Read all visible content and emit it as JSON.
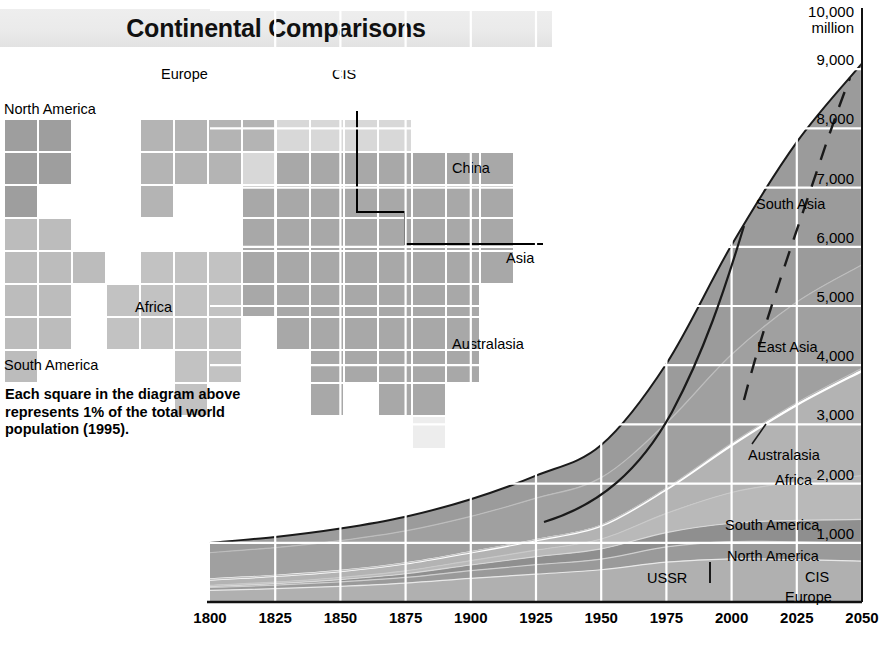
{
  "title": "Continental Comparisons",
  "waffle": {
    "caption": "Each square in the diagram above represents 1% of the total world population (1995).",
    "labels": {
      "north_america": "North America",
      "south_america": "South America",
      "europe": "Europe",
      "cis": "CIS",
      "africa": "Africa",
      "china": "China",
      "asia": "Asia",
      "australasia": "Australasia"
    },
    "cell_note": "1 square = 1% of world population (1995)",
    "colors": {
      "north_america": "#9e9e9e",
      "south_america": "#bcbcbc",
      "europe": "#b4b4b4",
      "cis": "#d8d8d8",
      "africa": "#c2c2c2",
      "asia": "#a8a8a8",
      "australasia": "#ededed"
    },
    "cells": [
      {
        "c": 0,
        "r": 0,
        "g": "north_america"
      },
      {
        "c": 1,
        "r": 0,
        "g": "north_america"
      },
      {
        "c": 0,
        "r": 1,
        "g": "north_america"
      },
      {
        "c": 1,
        "r": 1,
        "g": "north_america"
      },
      {
        "c": 0,
        "r": 2,
        "g": "north_america"
      },
      {
        "c": 0,
        "r": 3,
        "g": "south_america"
      },
      {
        "c": 1,
        "r": 3,
        "g": "south_america"
      },
      {
        "c": 0,
        "r": 4,
        "g": "south_america"
      },
      {
        "c": 1,
        "r": 4,
        "g": "south_america"
      },
      {
        "c": 2,
        "r": 4,
        "g": "south_america"
      },
      {
        "c": 0,
        "r": 5,
        "g": "south_america"
      },
      {
        "c": 1,
        "r": 5,
        "g": "south_america"
      },
      {
        "c": 0,
        "r": 6,
        "g": "south_america"
      },
      {
        "c": 1,
        "r": 6,
        "g": "south_america"
      },
      {
        "c": 0,
        "r": 7,
        "g": "south_america"
      },
      {
        "c": 4,
        "r": 0,
        "g": "europe"
      },
      {
        "c": 5,
        "r": 0,
        "g": "europe"
      },
      {
        "c": 6,
        "r": 0,
        "g": "europe"
      },
      {
        "c": 7,
        "r": 0,
        "g": "europe"
      },
      {
        "c": 8,
        "r": 0,
        "g": "cis"
      },
      {
        "c": 9,
        "r": 0,
        "g": "cis"
      },
      {
        "c": 10,
        "r": 0,
        "g": "cis"
      },
      {
        "c": 11,
        "r": 0,
        "g": "cis"
      },
      {
        "c": 4,
        "r": 1,
        "g": "europe"
      },
      {
        "c": 5,
        "r": 1,
        "g": "europe"
      },
      {
        "c": 6,
        "r": 1,
        "g": "europe"
      },
      {
        "c": 7,
        "r": 1,
        "g": "cis"
      },
      {
        "c": 4,
        "r": 2,
        "g": "europe"
      },
      {
        "c": 8,
        "r": 1,
        "g": "asia"
      },
      {
        "c": 9,
        "r": 1,
        "g": "asia"
      },
      {
        "c": 10,
        "r": 1,
        "g": "asia"
      },
      {
        "c": 11,
        "r": 1,
        "g": "asia"
      },
      {
        "c": 12,
        "r": 1,
        "g": "asia"
      },
      {
        "c": 13,
        "r": 1,
        "g": "asia"
      },
      {
        "c": 14,
        "r": 1,
        "g": "asia"
      },
      {
        "c": 7,
        "r": 2,
        "g": "asia"
      },
      {
        "c": 8,
        "r": 2,
        "g": "asia"
      },
      {
        "c": 9,
        "r": 2,
        "g": "asia"
      },
      {
        "c": 10,
        "r": 2,
        "g": "asia"
      },
      {
        "c": 11,
        "r": 2,
        "g": "asia"
      },
      {
        "c": 12,
        "r": 2,
        "g": "asia"
      },
      {
        "c": 13,
        "r": 2,
        "g": "asia"
      },
      {
        "c": 14,
        "r": 2,
        "g": "asia"
      },
      {
        "c": 7,
        "r": 3,
        "g": "asia"
      },
      {
        "c": 8,
        "r": 3,
        "g": "asia"
      },
      {
        "c": 9,
        "r": 3,
        "g": "asia"
      },
      {
        "c": 10,
        "r": 3,
        "g": "asia"
      },
      {
        "c": 11,
        "r": 3,
        "g": "asia"
      },
      {
        "c": 12,
        "r": 3,
        "g": "asia"
      },
      {
        "c": 13,
        "r": 3,
        "g": "asia"
      },
      {
        "c": 14,
        "r": 3,
        "g": "asia"
      },
      {
        "c": 4,
        "r": 4,
        "g": "africa"
      },
      {
        "c": 5,
        "r": 4,
        "g": "africa"
      },
      {
        "c": 6,
        "r": 4,
        "g": "africa"
      },
      {
        "c": 7,
        "r": 4,
        "g": "asia"
      },
      {
        "c": 8,
        "r": 4,
        "g": "asia"
      },
      {
        "c": 9,
        "r": 4,
        "g": "asia"
      },
      {
        "c": 10,
        "r": 4,
        "g": "asia"
      },
      {
        "c": 11,
        "r": 4,
        "g": "asia"
      },
      {
        "c": 12,
        "r": 4,
        "g": "asia"
      },
      {
        "c": 13,
        "r": 4,
        "g": "asia"
      },
      {
        "c": 14,
        "r": 4,
        "g": "asia"
      },
      {
        "c": 3,
        "r": 5,
        "g": "africa"
      },
      {
        "c": 4,
        "r": 5,
        "g": "africa"
      },
      {
        "c": 5,
        "r": 5,
        "g": "africa"
      },
      {
        "c": 6,
        "r": 5,
        "g": "africa"
      },
      {
        "c": 7,
        "r": 5,
        "g": "asia"
      },
      {
        "c": 8,
        "r": 5,
        "g": "asia"
      },
      {
        "c": 9,
        "r": 5,
        "g": "asia"
      },
      {
        "c": 10,
        "r": 5,
        "g": "asia"
      },
      {
        "c": 11,
        "r": 5,
        "g": "asia"
      },
      {
        "c": 12,
        "r": 5,
        "g": "asia"
      },
      {
        "c": 13,
        "r": 5,
        "g": "asia"
      },
      {
        "c": 3,
        "r": 6,
        "g": "africa"
      },
      {
        "c": 4,
        "r": 6,
        "g": "africa"
      },
      {
        "c": 5,
        "r": 6,
        "g": "africa"
      },
      {
        "c": 6,
        "r": 6,
        "g": "africa"
      },
      {
        "c": 8,
        "r": 6,
        "g": "asia"
      },
      {
        "c": 9,
        "r": 6,
        "g": "asia"
      },
      {
        "c": 10,
        "r": 6,
        "g": "asia"
      },
      {
        "c": 11,
        "r": 6,
        "g": "asia"
      },
      {
        "c": 12,
        "r": 6,
        "g": "asia"
      },
      {
        "c": 13,
        "r": 6,
        "g": "asia"
      },
      {
        "c": 5,
        "r": 7,
        "g": "africa"
      },
      {
        "c": 6,
        "r": 7,
        "g": "africa"
      },
      {
        "c": 9,
        "r": 7,
        "g": "asia"
      },
      {
        "c": 10,
        "r": 7,
        "g": "asia"
      },
      {
        "c": 11,
        "r": 7,
        "g": "asia"
      },
      {
        "c": 12,
        "r": 7,
        "g": "asia"
      },
      {
        "c": 13,
        "r": 7,
        "g": "asia"
      },
      {
        "c": 5,
        "r": 8,
        "g": "africa"
      },
      {
        "c": 9,
        "r": 8,
        "g": "asia"
      },
      {
        "c": 11,
        "r": 8,
        "g": "asia"
      },
      {
        "c": 12,
        "r": 8,
        "g": "asia"
      },
      {
        "c": 12,
        "r": 9,
        "g": "australasia"
      }
    ]
  },
  "chart_data": {
    "type": "area",
    "xlabel": "",
    "ylabel": "million",
    "x": [
      1800,
      1825,
      1850,
      1875,
      1900,
      1925,
      1950,
      1975,
      2000,
      2025,
      2050
    ],
    "xticks": [
      "1800",
      "1825",
      "1850",
      "1875",
      "1900",
      "1925",
      "1950",
      "1975",
      "2000",
      "2025",
      "2050"
    ],
    "yticks": [
      "1,000",
      "2,000",
      "3,000",
      "4,000",
      "5,000",
      "6,000",
      "7,000",
      "8,000",
      "9,000",
      "10,000"
    ],
    "y_top_label": "10,000",
    "y_top_unit": "million",
    "ylim": [
      0,
      10000
    ],
    "xlim": [
      1800,
      2050
    ],
    "grid": true,
    "legend": "inline-band-labels",
    "band_order_bottom_to_top": [
      "Europe",
      "CIS",
      "North America",
      "South America",
      "Africa",
      "Australasia",
      "East Asia",
      "South Asia"
    ],
    "inline_labels": [
      "Europe",
      "CIS",
      "USSR",
      "North America",
      "South America",
      "Africa",
      "Australasia",
      "East Asia",
      "South Asia"
    ],
    "series": [
      {
        "name": "Europe",
        "values": [
          195,
          225,
          265,
          320,
          400,
          470,
          545,
          675,
          730,
          715,
          690
        ]
      },
      {
        "name": "CIS",
        "values": [
          50,
          60,
          75,
          95,
          130,
          160,
          180,
          255,
          290,
          300,
          305
        ]
      },
      {
        "name": "North America",
        "values": [
          16,
          25,
          39,
          62,
          95,
          135,
          172,
          243,
          310,
          365,
          400
        ]
      },
      {
        "name": "South America",
        "values": [
          20,
          27,
          35,
          50,
          75,
          110,
          167,
          325,
          520,
          650,
          740
        ]
      },
      {
        "name": "Africa",
        "values": [
          100,
          105,
          110,
          125,
          140,
          170,
          224,
          406,
          800,
          1300,
          1770
        ]
      },
      {
        "name": "Australasia",
        "values": [
          2,
          2,
          3,
          4,
          6,
          9,
          13,
          21,
          30,
          37,
          42
        ]
      },
      {
        "name": "East Asia",
        "values": [
          450,
          475,
          510,
          545,
          600,
          700,
          800,
          1100,
          1500,
          1700,
          1750
        ]
      },
      {
        "name": "South Asia",
        "values": [
          165,
          180,
          205,
          240,
          290,
          380,
          550,
          1000,
          1850,
          2700,
          3400
        ]
      }
    ],
    "total": [
      998,
      1099,
      1242,
      1441,
      1736,
      2134,
      2651,
      4025,
      6030,
      7767,
      9097
    ],
    "annotations": [
      {
        "text": "USSR",
        "note": "former-USSR boundary marker before 1991"
      },
      {
        "text": "CIS",
        "note": "post-1991 successor states"
      }
    ]
  }
}
